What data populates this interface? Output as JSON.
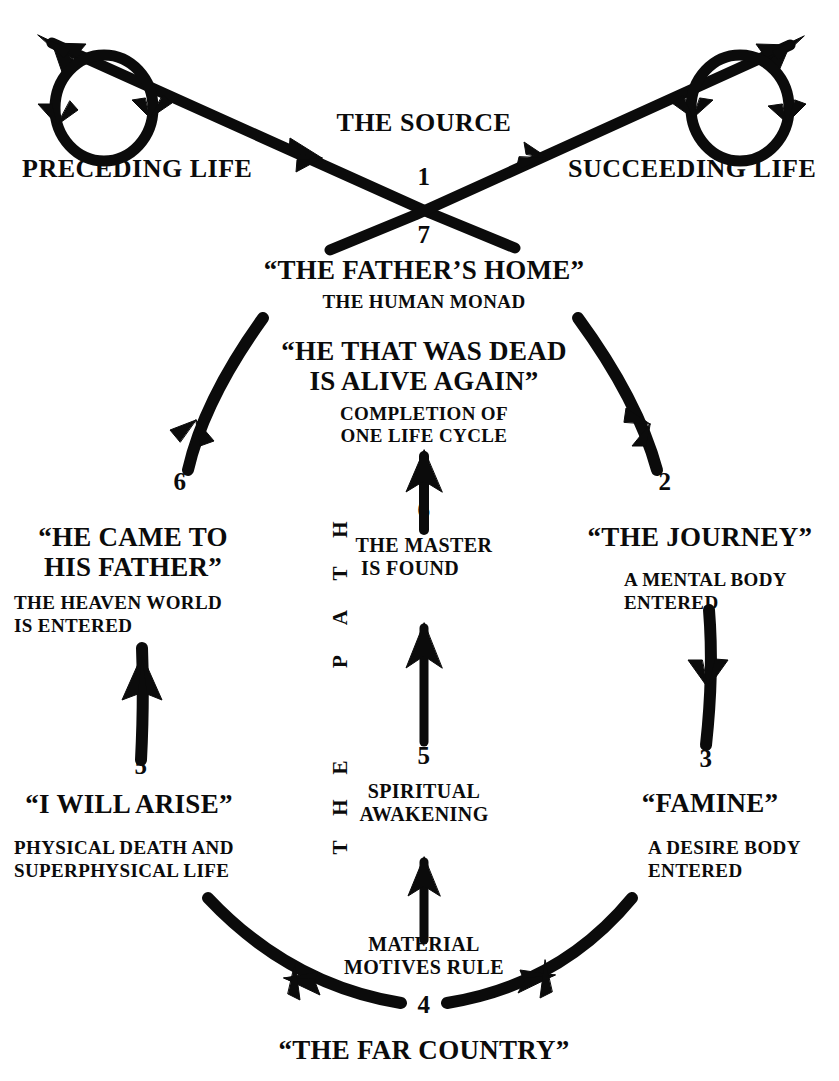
{
  "diagram": {
    "title": "THE SOURCE",
    "type": "cycle-diagram",
    "background": "#ffffff",
    "ink": "#0b0b0b"
  },
  "top": {
    "source_label": "THE SOURCE",
    "preceding_life": "PRECEDING LIFE",
    "succeeding_life": "SUCCEEDING LIFE",
    "step_1": "1",
    "step_7": "7"
  },
  "apex": {
    "title": "“THE FATHER’S HOME”",
    "subtitle": "THE HUMAN MONAD",
    "quote_line1": "“HE THAT WAS DEAD",
    "quote_line2": "IS ALIVE AGAIN”",
    "note_line1": "COMPLETION OF",
    "note_line2": "ONE LIFE CYCLE"
  },
  "left": {
    "step_6": "6",
    "stage_title_line1": "“HE CAME TO",
    "stage_title_line2": "HIS FATHER”",
    "stage_note_line1": "THE HEAVEN WORLD",
    "stage_note_line2": "IS ENTERED",
    "step_5": "5",
    "stage2_title": "“I WILL ARISE”",
    "stage2_note_line1": "PHYSICAL DEATH AND",
    "stage2_note_line2": "SUPERPHYSICAL LIFE"
  },
  "right": {
    "step_2": "2",
    "stage_title": "“THE JOURNEY”",
    "stage_note_line1": "A MENTAL BODY",
    "stage_note_line2": "ENTERED",
    "step_3": "3",
    "stage2_title": "“FAMINE”",
    "stage2_note_line1": "A DESIRE BODY",
    "stage2_note_line2": "ENTERED"
  },
  "center": {
    "path_letters": [
      "H",
      "T",
      "A",
      "P",
      "E",
      "H",
      "T"
    ],
    "path_reading": "THE PATH",
    "step_6": "6",
    "master_line1": "THE MASTER",
    "master_line2": "IS FOUND",
    "step_5": "5",
    "awaken_line1": "SPIRITUAL",
    "awaken_line2": "AWAKENING",
    "material_line1": "MATERIAL",
    "material_line2": "MOTIVES RULE"
  },
  "bottom": {
    "step_4": "4",
    "far_country": "“THE FAR COUNTRY”"
  }
}
